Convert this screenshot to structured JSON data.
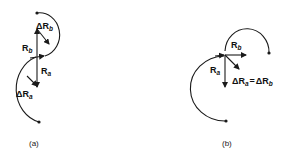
{
  "figure": {
    "panels": [
      {
        "id": "a",
        "caption": "(a)",
        "labels": {
          "rb": {
            "main": "R",
            "sub": "b"
          },
          "delta_rb": {
            "main": "ΔR",
            "sub": "b"
          },
          "ra": {
            "main": "R",
            "sub": "a"
          },
          "delta_ra": {
            "main": "ΔR",
            "sub": "a"
          }
        }
      },
      {
        "id": "b",
        "caption": "(b)",
        "labels": {
          "rb": {
            "main": "R",
            "sub": "b"
          },
          "ra": {
            "main": "R",
            "sub": "a"
          },
          "delta_eq_lhs": {
            "main": "ΔR",
            "sub": "a"
          },
          "equals": "=",
          "delta_eq_rhs": {
            "main": "ΔR",
            "sub": "b"
          }
        }
      }
    ],
    "colors": {
      "stroke": "#1a1a1a",
      "background": "#ffffff"
    }
  }
}
